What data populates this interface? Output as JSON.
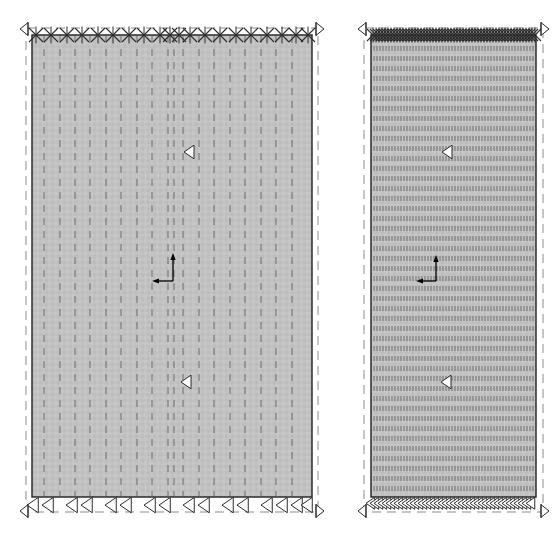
{
  "canvas": {
    "width": 560,
    "height": 541,
    "background": "#ffffff",
    "title": "Finite element mesh comparison — coarse vs. refined vertical discretisation"
  },
  "style": {
    "fill_color": "#c2c2c2",
    "outline_color": "#1f1f1f",
    "mesh_line_color": "#6d6d6d",
    "dashed_boundary_color": "#8c8c8c",
    "marker_stroke_color": "#2b2b2b",
    "marker_fill_color": "#ffffff",
    "axis_color": "#000000",
    "outline_width": 1.4,
    "mesh_line_width": 1.0,
    "mesh_dash": "7 6",
    "dense_mesh_dash": "5 5",
    "boundary_dash": "9 6"
  },
  "legend_labels": {
    "support_marker": "pinned-support-marker",
    "load_marker": "load-arrow-marker",
    "axis_marker": "coordinate-axis-marker",
    "extent_marker": "extent-arrow-marker"
  },
  "panels": [
    {
      "id": "coarse-mesh-panel",
      "name": "Coarse mesh panel",
      "body": {
        "x": 32,
        "y": 35,
        "width": 280,
        "height": 462
      },
      "outer_boundary": {
        "x": 26,
        "y": 28,
        "width": 292,
        "height": 484
      },
      "mesh": {
        "type": "vertical-dashed-lines",
        "count": 18,
        "dash": "7 6",
        "positions": [
          44,
          60,
          75,
          90,
          106,
          121,
          137,
          152,
          168,
          174,
          183,
          199,
          214,
          230,
          245,
          261,
          276,
          292
        ]
      },
      "top_supports": {
        "symbol": "x-cross",
        "count": 20,
        "y": 35,
        "size": 7,
        "positions": [
          36,
          51,
          67,
          82,
          98,
          113,
          129,
          144,
          160,
          170,
          179,
          190,
          205,
          220,
          236,
          251,
          267,
          282,
          296,
          308
        ]
      },
      "bottom_loads": {
        "symbol": "left-triangle",
        "count": 16,
        "y": 497,
        "size": 9,
        "positions": [
          36,
          51,
          75,
          90,
          114,
          129,
          153,
          168,
          192,
          207,
          231,
          246,
          270,
          285,
          300,
          310
        ]
      },
      "corner_markers": [
        {
          "name": "extent-arrow-top-left",
          "x": 28,
          "y": 29,
          "dir": "left"
        },
        {
          "name": "extent-arrow-top-right",
          "x": 316,
          "y": 29,
          "dir": "right"
        },
        {
          "name": "extent-arrow-bottom-left",
          "x": 28,
          "y": 511,
          "dir": "left"
        },
        {
          "name": "extent-arrow-bottom-right",
          "x": 316,
          "y": 511,
          "dir": "right"
        }
      ],
      "interior_markers": [
        {
          "name": "interior-triangle-upper",
          "x": 192,
          "y": 152,
          "dir": "left"
        },
        {
          "name": "interior-triangle-lower",
          "x": 189,
          "y": 382,
          "dir": "left"
        }
      ],
      "axis_indicator": {
        "origin_x": 173,
        "origin_y": 281,
        "up_length": 24,
        "left_length": 17,
        "vertical_axis_label": "",
        "horizontal_axis_label": ""
      }
    },
    {
      "id": "refined-mesh-panel",
      "name": "Refined mesh panel",
      "body": {
        "x": 371,
        "y": 35,
        "width": 165,
        "height": 462
      },
      "outer_boundary": {
        "x": 364,
        "y": 28,
        "width": 179,
        "height": 484
      },
      "mesh": {
        "type": "vertical-dashed-lines",
        "count": 56,
        "dash": "5 5",
        "spacing": 3,
        "start": 374,
        "end": 534
      },
      "top_supports": {
        "symbol": "x-cross",
        "count": 56,
        "y": 35,
        "size": 6,
        "spacing": 3,
        "start": 373,
        "end": 535
      },
      "bottom_loads": {
        "symbol": "left-triangle",
        "count": 42,
        "y": 497,
        "size": 7,
        "spacing": 4,
        "start": 373,
        "end": 535
      },
      "corner_markers": [
        {
          "name": "extent-arrow-top-left",
          "x": 366,
          "y": 29,
          "dir": "left"
        },
        {
          "name": "extent-arrow-top-right",
          "x": 541,
          "y": 29,
          "dir": "right"
        },
        {
          "name": "extent-arrow-bottom-left",
          "x": 366,
          "y": 511,
          "dir": "left"
        },
        {
          "name": "extent-arrow-bottom-right",
          "x": 541,
          "y": 511,
          "dir": "right"
        }
      ],
      "interior_markers": [
        {
          "name": "interior-triangle-upper",
          "x": 450,
          "y": 152,
          "dir": "left"
        },
        {
          "name": "interior-triangle-lower",
          "x": 449,
          "y": 382,
          "dir": "left"
        }
      ],
      "axis_indicator": {
        "origin_x": 436,
        "origin_y": 281,
        "up_length": 22,
        "left_length": 16,
        "vertical_axis_label": "",
        "horizontal_axis_label": ""
      }
    }
  ]
}
